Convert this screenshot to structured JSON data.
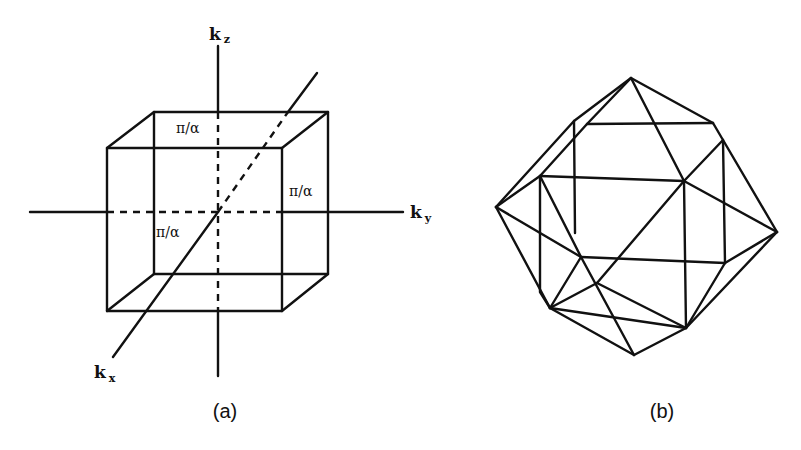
{
  "panels": [
    {
      "id": "a",
      "caption": "(a)",
      "description": "Cubic first Brillouin zone of simple cubic lattice",
      "axes": {
        "kz": {
          "base": "k",
          "sub": "z"
        },
        "ky": {
          "base": "k",
          "sub": "y"
        },
        "kx": {
          "base": "k",
          "sub": "x"
        }
      },
      "dimension_labels": [
        "π/α",
        "π/α",
        "π/α"
      ]
    },
    {
      "id": "b",
      "caption": "(b)",
      "description": "Polyhedral Brillouin zone (wireframe)"
    }
  ],
  "colors": {
    "line": "#111111",
    "background": "#ffffff"
  }
}
